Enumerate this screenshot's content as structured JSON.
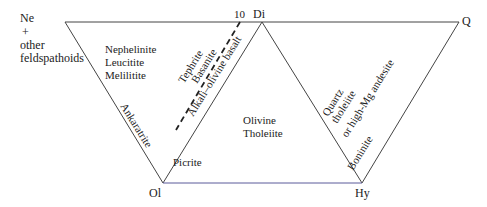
{
  "diagram": {
    "type": "basalt tetrahedron projection (Ne-Di-Q-Ol-Hy)",
    "vertices": {
      "ne": [
        "Ne",
        "+",
        "other",
        "feldspathoids"
      ],
      "di": "Di",
      "q": "Q",
      "ol": "Ol",
      "hy": "Hy",
      "tick_10": "10"
    },
    "fields": {
      "nephelinite_group": [
        "Nephelinite",
        "Leucitite",
        "Melilitite"
      ],
      "ankaratrite": "Ankaratrite",
      "tephrite": "Tephrite",
      "basanite": "Basanite",
      "alkali_olivine_basalt": "Alkali–olivine basalt",
      "olivine_tholeiite": [
        "Olivine",
        "Tholeiite"
      ],
      "picrite": "Picrite",
      "quartz_tholeiite": [
        "Quartz",
        "tholeiite",
        "or high-Mg andesite"
      ],
      "boninite": "Boninite"
    },
    "colors": {
      "line": "#444444",
      "bottom_line": "#5a5a9a",
      "text": "#222222"
    }
  }
}
